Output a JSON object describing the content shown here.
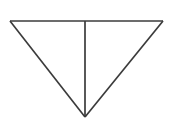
{
  "canvas": {
    "width": 173,
    "height": 131,
    "background_color": "#ffffff",
    "description": "Inverted triangle bisected by a vertical median line"
  },
  "figure": {
    "name": "inverted-triangle-with-median",
    "stroke_color": "#3b3b3b",
    "fill_color": "#ffffff",
    "stroke_width": 1.7,
    "vertices": {
      "top_left": {
        "x": 10,
        "y": 21
      },
      "top_right": {
        "x": 163,
        "y": 21
      },
      "bottom_apex": {
        "x": 85,
        "y": 117
      },
      "top_midpoint": {
        "x": 85,
        "y": 21
      }
    },
    "edges": [
      {
        "name": "top-edge",
        "from": "top_left",
        "to": "top_right",
        "path": "M 10 21 L 163 21"
      },
      {
        "name": "left-edge",
        "from": "top_left",
        "to": "bottom_apex",
        "path": "M 10 21 L 85 117"
      },
      {
        "name": "right-edge",
        "from": "top_right",
        "to": "bottom_apex",
        "path": "M 163 21 L 85 117"
      },
      {
        "name": "median-line",
        "from": "top_midpoint",
        "to": "bottom_apex",
        "path": "M 85 21 L 85 117"
      }
    ],
    "outline_path": "M 10 21 L 163 21 L 85 117 Z"
  },
  "labels": {
    "figure_title": "",
    "caption": ""
  }
}
